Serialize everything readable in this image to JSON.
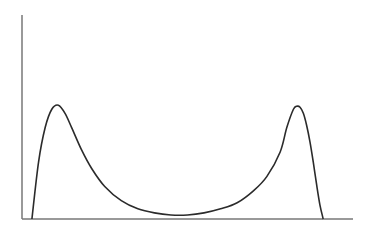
{
  "chart_data": {
    "type": "line",
    "title": "",
    "xlabel": "",
    "ylabel": "",
    "xlim": [
      0,
      1
    ],
    "ylim": [
      0,
      1
    ],
    "grid": false,
    "legend": null,
    "x_ticks": [],
    "y_ticks": [],
    "series": [
      {
        "name": "bimodal density",
        "color": "#2b2b2b",
        "x": [
          0.03,
          0.05,
          0.07,
          0.09,
          0.11,
          0.13,
          0.15,
          0.18,
          0.21,
          0.25,
          0.3,
          0.35,
          0.4,
          0.45,
          0.5,
          0.55,
          0.6,
          0.65,
          0.7,
          0.74,
          0.78,
          0.8,
          0.82,
          0.83,
          0.84,
          0.85,
          0.86,
          0.87,
          0.88,
          0.89,
          0.9,
          0.91
        ],
        "y": [
          0.0,
          0.28,
          0.45,
          0.54,
          0.56,
          0.52,
          0.45,
          0.34,
          0.25,
          0.16,
          0.09,
          0.05,
          0.03,
          0.02,
          0.02,
          0.03,
          0.05,
          0.08,
          0.14,
          0.21,
          0.33,
          0.45,
          0.54,
          0.555,
          0.55,
          0.52,
          0.46,
          0.38,
          0.28,
          0.17,
          0.07,
          0.0
        ]
      }
    ]
  }
}
